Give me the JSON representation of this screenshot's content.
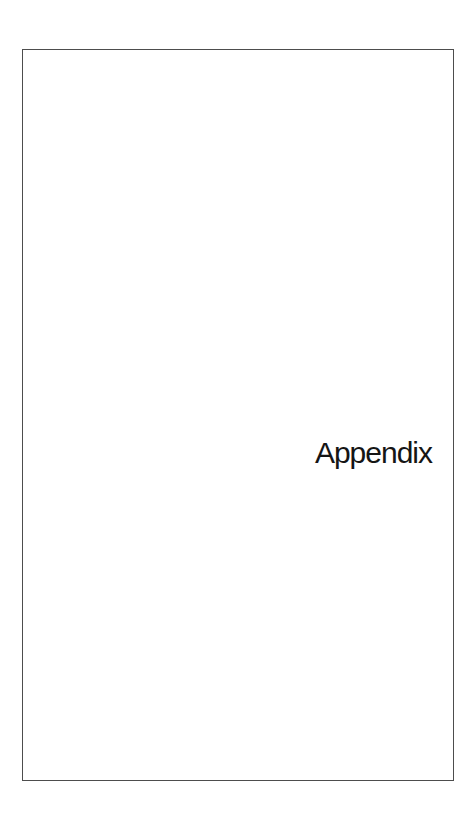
{
  "document": {
    "heading": "Appendix",
    "colors": {
      "background": "#ffffff",
      "frame_border": "#4d4d4d",
      "text": "#151515"
    }
  }
}
